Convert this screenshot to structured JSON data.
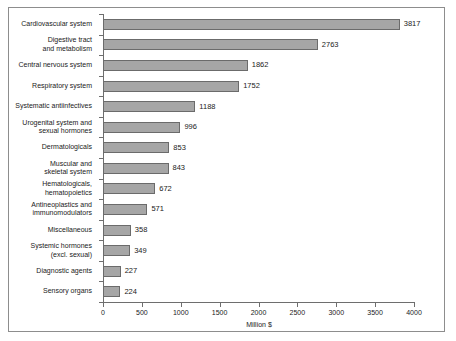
{
  "chart_data": {
    "type": "bar",
    "orientation": "horizontal",
    "title": "",
    "xlabel": "Million $",
    "ylabel": "",
    "xlim": [
      0,
      4000
    ],
    "xticks": [
      0,
      500,
      1000,
      1500,
      2000,
      2500,
      3000,
      3500,
      4000
    ],
    "xtick_labels": [
      "0",
      "500",
      "1000",
      "1500",
      "2000",
      "2500",
      "3000",
      "3500",
      "4000"
    ],
    "grid": false,
    "legend": null,
    "bar_color": "#a6a6a6",
    "bar_edge_color": "#6b6b6b",
    "axis_color": "#6e6e6e",
    "categories": [
      "Cardiovascular system",
      "Digestive tract\nand metabolism",
      "Central nervous system",
      "Respiratory system",
      "Systematic antiinfectives",
      "Urogenital system and\nsexual hormones",
      "Dermatologicals",
      "Muscular and\nskeletal system",
      "Hematologicals,\nhematopoietics",
      "Antineoplastics and\nimmunomodulators",
      "Miscellaneous",
      "Systemic hormones\n(excl. sexual)",
      "Diagnostic agents",
      "Sensory organs"
    ],
    "values": [
      3817,
      2763,
      1862,
      1752,
      1188,
      996,
      853,
      843,
      672,
      571,
      358,
      349,
      227,
      224
    ],
    "value_labels": [
      "3817",
      "2763",
      "1862",
      "1752",
      "1188",
      "996",
      "853",
      "843",
      "672",
      "571",
      "358",
      "349",
      "227",
      "224"
    ]
  }
}
